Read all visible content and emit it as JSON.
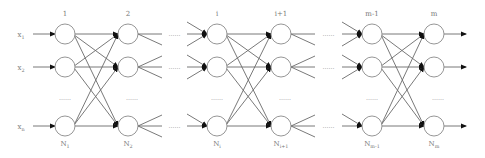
{
  "diagram": {
    "type": "feedforward-network",
    "colors": {
      "line": "#6a6a6a",
      "node_stroke": "#8a8a8a",
      "text": "#777777",
      "arrow": "#111111"
    },
    "inputs": [
      {
        "label": "x",
        "sub": "1",
        "y": 34
      },
      {
        "label": "x",
        "sub": "2",
        "y": 67
      },
      {
        "label": "x",
        "sub": "n",
        "y": 126
      }
    ],
    "layers": [
      {
        "top_label": "1",
        "bottom_label": "N",
        "bottom_sub": "1",
        "x": 65
      },
      {
        "top_label": "2",
        "bottom_label": "N",
        "bottom_sub": "2",
        "x": 128
      },
      {
        "top_label": "i",
        "bottom_label": "N",
        "bottom_sub": "i",
        "x": 217
      },
      {
        "top_label": "i+1",
        "bottom_label": "N",
        "bottom_sub": "i+1",
        "x": 281
      },
      {
        "top_label": "m-1",
        "bottom_label": "N",
        "bottom_sub": "m-1",
        "x": 372
      },
      {
        "top_label": "m",
        "bottom_label": "N",
        "bottom_sub": "m",
        "x": 434
      }
    ],
    "rows_y": [
      34,
      67,
      126
    ],
    "vertical_ellipsis": "……",
    "horizontal_ellipsis": "……",
    "dense_pairs": [
      [
        0,
        1
      ],
      [
        2,
        3
      ],
      [
        4,
        5
      ]
    ],
    "gap_pairs": [
      [
        1,
        2
      ],
      [
        3,
        4
      ]
    ]
  }
}
